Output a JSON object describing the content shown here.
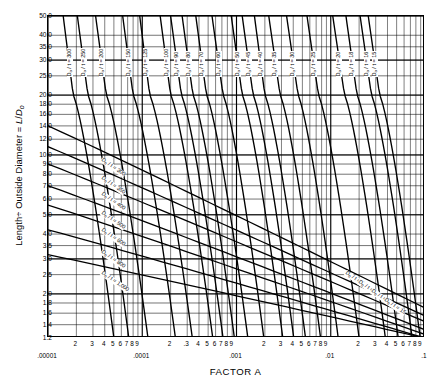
{
  "chart_data": {
    "type": "line",
    "title": "",
    "xlabel": "FACTOR A",
    "ylabel": "Length ÷ Outside Diameter = L/Do",
    "xscale": "log",
    "yscale": "log",
    "xlim": [
      1e-05,
      0.1
    ],
    "ylim": [
      1.2,
      50.0
    ],
    "grid": true,
    "legend": "none",
    "x_decade_labels": [
      ".00001",
      ".0001",
      ".001",
      ".01",
      ".1"
    ],
    "x_decade_values": [
      1e-05,
      0.0001,
      0.001,
      0.01,
      0.1
    ],
    "x_minor_labels": [
      "2",
      "3",
      "4",
      "5",
      "6",
      "7",
      "8",
      "9"
    ],
    "y_tick_labels": [
      "50.0",
      "40.0",
      "35.0",
      "30.0",
      "25.0",
      "20.0",
      "18.0",
      "16.0",
      "14.0",
      "12.0",
      "10.0",
      "9.0",
      "8.0",
      "7.0",
      "6.0",
      "5.0",
      "4.0",
      "3.5",
      "3.0",
      "2.5",
      "2.0",
      "1.8",
      "1.6",
      "1.4",
      "1.2"
    ],
    "y_tick_values": [
      50.0,
      40.0,
      35.0,
      30.0,
      25.0,
      20.0,
      18.0,
      16.0,
      14.0,
      12.0,
      10.0,
      9.0,
      8.0,
      7.0,
      6.0,
      5.0,
      4.0,
      3.5,
      3.0,
      2.5,
      2.0,
      1.8,
      1.6,
      1.4,
      1.2
    ],
    "series_label_prefix": "Do / t =",
    "upper_curves": [
      {
        "label": "300",
        "x_at_top": 1.45e-05,
        "x_knee": 1.85e-05,
        "x_bottom": 5e-05
      },
      {
        "label": "250",
        "x_at_top": 2.05e-05,
        "x_knee": 2.65e-05,
        "x_bottom": 7.2e-05
      },
      {
        "label": "200",
        "x_at_top": 3.2e-05,
        "x_knee": 4.15e-05,
        "x_bottom": 0.000115
      },
      {
        "label": "150",
        "x_at_top": 6.2e-05,
        "x_knee": 8e-05,
        "x_bottom": 0.000225
      },
      {
        "label": "125",
        "x_at_top": 9.4e-05,
        "x_knee": 0.00012,
        "x_bottom": 0.00034
      },
      {
        "label": "100",
        "x_at_top": 0.000155,
        "x_knee": 0.0002,
        "x_bottom": 0.00056
      },
      {
        "label": "90",
        "x_at_top": 0.0002,
        "x_knee": 0.00026,
        "x_bottom": 0.00072
      },
      {
        "label": "80",
        "x_at_top": 0.000265,
        "x_knee": 0.000345,
        "x_bottom": 0.00095
      },
      {
        "label": "70",
        "x_at_top": 0.00037,
        "x_knee": 0.00048,
        "x_bottom": 0.00132
      },
      {
        "label": "60",
        "x_at_top": 0.00055,
        "x_knee": 0.00072,
        "x_bottom": 0.00195
      },
      {
        "label": "50",
        "x_at_top": 0.00088,
        "x_knee": 0.00115,
        "x_bottom": 0.0031
      },
      {
        "label": "45",
        "x_at_top": 0.00115,
        "x_knee": 0.0015,
        "x_bottom": 0.00405
      },
      {
        "label": "40",
        "x_at_top": 0.00155,
        "x_knee": 0.002,
        "x_bottom": 0.0054
      },
      {
        "label": "35",
        "x_at_top": 0.0022,
        "x_knee": 0.0029,
        "x_bottom": 0.0078
      },
      {
        "label": "30",
        "x_at_top": 0.0034,
        "x_knee": 0.0045,
        "x_bottom": 0.012
      },
      {
        "label": "25",
        "x_at_top": 0.0056,
        "x_knee": 0.0074,
        "x_bottom": 0.02
      },
      {
        "label": "20",
        "x_at_top": 0.0105,
        "x_knee": 0.014,
        "x_bottom": 0.038
      },
      {
        "label": "18",
        "x_at_top": 0.0145,
        "x_knee": 0.019,
        "x_bottom": 0.052
      },
      {
        "label": "16",
        "x_at_top": 0.0205,
        "x_knee": 0.027,
        "x_bottom": 0.073
      },
      {
        "label": "15",
        "x_at_top": 0.025,
        "x_knee": 0.033,
        "x_bottom": 0.089
      }
    ],
    "lower_diagonals": [
      {
        "label": "1,000",
        "x_left": 1e-05,
        "y_left": 3.15,
        "x_right": 0.1,
        "y_right": 1.2
      },
      {
        "label": "800",
        "x_left": 1e-05,
        "y_left": 4.2,
        "x_right": 0.1,
        "y_right": 1.2
      },
      {
        "label": "600",
        "x_left": 1e-05,
        "y_left": 5.6,
        "x_right": 0.1,
        "y_right": 1.25
      },
      {
        "label": "500",
        "x_left": 1e-05,
        "y_left": 7.0,
        "x_right": 0.1,
        "y_right": 1.32
      },
      {
        "label": "400",
        "x_left": 1e-05,
        "y_left": 9.0,
        "x_right": 0.1,
        "y_right": 1.45
      },
      {
        "label": "350",
        "x_left": 1e-05,
        "y_left": 11.0,
        "x_right": 0.1,
        "y_right": 1.55
      },
      {
        "label": "300",
        "x_left": 1e-05,
        "y_left": 14.0,
        "x_right": 0.1,
        "y_right": 1.7
      }
    ],
    "bottom_right_labels": [
      "8",
      "10",
      "12",
      "15"
    ]
  }
}
